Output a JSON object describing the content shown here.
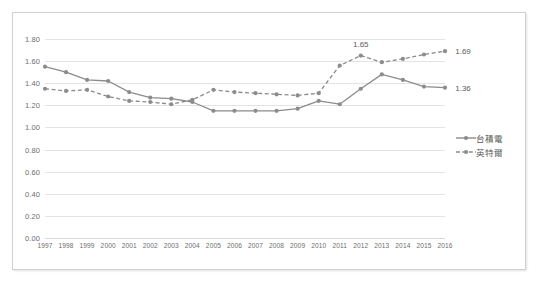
{
  "chart_data": {
    "type": "line",
    "title": "",
    "xlabel": "",
    "ylabel": "",
    "ylim": [
      0.0,
      1.8
    ],
    "ytick_step": 0.2,
    "grid": true,
    "legend_position": "right",
    "categories": [
      "1997",
      "1998",
      "1999",
      "2000",
      "2001",
      "2002",
      "2003",
      "2004",
      "2005",
      "2006",
      "2007",
      "2008",
      "2009",
      "2010",
      "2011",
      "2012",
      "2013",
      "2014",
      "2015",
      "2016"
    ],
    "ytick_labels": [
      "0.00",
      "0.20",
      "0.40",
      "0.60",
      "0.80",
      "1.00",
      "1.20",
      "1.40",
      "1.60",
      "1.80"
    ],
    "series": [
      {
        "name": "台積電",
        "style": "solid",
        "color": "#8c8c8c",
        "values": [
          1.55,
          1.5,
          1.43,
          1.42,
          1.32,
          1.27,
          1.26,
          1.23,
          1.15,
          1.15,
          1.15,
          1.15,
          1.17,
          1.24,
          1.21,
          1.35,
          1.48,
          1.43,
          1.37,
          1.36
        ]
      },
      {
        "name": "英特爾",
        "style": "dashed",
        "color": "#8c8c8c",
        "values": [
          1.35,
          1.33,
          1.34,
          1.28,
          1.24,
          1.23,
          1.21,
          1.25,
          1.34,
          1.32,
          1.31,
          1.3,
          1.29,
          1.31,
          1.56,
          1.65,
          1.59,
          1.62,
          1.66,
          1.69
        ]
      }
    ],
    "data_labels": [
      {
        "series": "英特爾",
        "category": "2012",
        "value": "1.65"
      },
      {
        "series": "英特爾",
        "category": "2016",
        "value": "1.69"
      },
      {
        "series": "台積電",
        "category": "2016",
        "value": "1.36"
      }
    ]
  },
  "legend": {
    "items": [
      {
        "label": "台積電",
        "style": "solid"
      },
      {
        "label": "英特爾",
        "style": "dashed"
      }
    ]
  }
}
